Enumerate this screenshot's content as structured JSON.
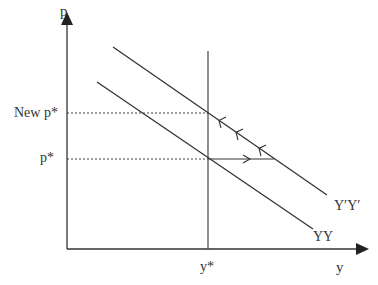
{
  "diagram": {
    "axes": {
      "y_label": "p",
      "x_label": "y"
    },
    "price_levels": {
      "new": "New p*",
      "old": "p*"
    },
    "output_level": "y*",
    "curves": {
      "original": "YY",
      "shifted": "Y′Y′"
    },
    "colors": {
      "line": "#333333",
      "background": "#ffffff"
    }
  }
}
